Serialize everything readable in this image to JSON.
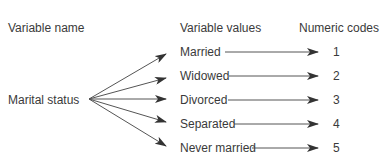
{
  "headers": {
    "variable_name": "Variable name",
    "variable_values": "Variable values",
    "numeric_codes": "Numeric codes"
  },
  "variable": "Marital status",
  "values": [
    {
      "label": "Married",
      "code": "1"
    },
    {
      "label": "Widowed",
      "code": "2"
    },
    {
      "label": "Divorced",
      "code": "3"
    },
    {
      "label": "Separated",
      "code": "4"
    },
    {
      "label": "Never married",
      "code": "5"
    }
  ]
}
